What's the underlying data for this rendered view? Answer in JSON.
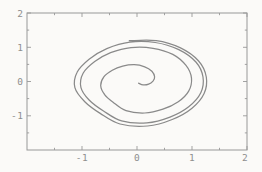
{
  "figure": {
    "background_color": "#fbfaf8",
    "frame_color": "#989898",
    "curve_color": "#8a8a8a",
    "label_color": "#8e8e8e"
  },
  "chart_data": {
    "type": "line",
    "title": "",
    "xlabel": "",
    "ylabel": "",
    "xlim": [
      -2,
      2
    ],
    "ylim": [
      -2,
      2
    ],
    "grid": false,
    "legend_position": "none",
    "framed": true,
    "x_ticks": {
      "major": [
        {
          "value": -1,
          "label": "-1"
        },
        {
          "value": 0,
          "label": "0"
        },
        {
          "value": 1,
          "label": "1"
        },
        {
          "value": 2,
          "label": "2"
        }
      ],
      "minor": [
        -1.5,
        -0.5,
        0.5,
        1.5
      ]
    },
    "y_ticks": {
      "major": [
        {
          "value": 2,
          "label": "2"
        },
        {
          "value": 1,
          "label": "1"
        },
        {
          "value": 0,
          "label": "0"
        },
        {
          "value": -1,
          "label": "-1"
        }
      ],
      "minor": [
        -1.5,
        -0.5,
        0.5,
        1.5
      ]
    },
    "series": [
      {
        "name": "phase-trajectory",
        "description": "Trajectory spiraling outward from near the origin onto a closed limit cycle (phase-plane portrait), winding counterclockwise about 3.5 turns",
        "points": [
          [
            0.03,
            -0.05
          ],
          [
            0.11,
            -0.1
          ],
          [
            0.21,
            -0.08
          ],
          [
            0.29,
            0.01
          ],
          [
            0.32,
            0.14
          ],
          [
            0.27,
            0.3
          ],
          [
            0.14,
            0.43
          ],
          [
            -0.05,
            0.49
          ],
          [
            -0.26,
            0.45
          ],
          [
            -0.45,
            0.33
          ],
          [
            -0.6,
            0.14
          ],
          [
            -0.66,
            -0.12
          ],
          [
            -0.59,
            -0.38
          ],
          [
            -0.43,
            -0.61
          ],
          [
            -0.2,
            -0.85
          ],
          [
            0.14,
            -0.92
          ],
          [
            0.47,
            -0.81
          ],
          [
            0.75,
            -0.59
          ],
          [
            0.94,
            -0.28
          ],
          [
            0.99,
            0.1
          ],
          [
            0.89,
            0.47
          ],
          [
            0.65,
            0.79
          ],
          [
            0.29,
            0.97
          ],
          [
            -0.11,
            0.99
          ],
          [
            -0.48,
            0.84
          ],
          [
            -0.77,
            0.58
          ],
          [
            -0.98,
            0.24
          ],
          [
            -1.02,
            -0.17
          ],
          [
            -0.87,
            -0.54
          ],
          [
            -0.61,
            -0.86
          ],
          [
            -0.28,
            -1.15
          ],
          [
            0.18,
            -1.21
          ],
          [
            0.6,
            -1.04
          ],
          [
            0.94,
            -0.74
          ],
          [
            1.16,
            -0.33
          ],
          [
            1.2,
            0.13
          ],
          [
            1.07,
            0.57
          ],
          [
            0.76,
            0.93
          ],
          [
            0.33,
            1.14
          ],
          [
            -0.13,
            1.15
          ],
          [
            -0.55,
            0.96
          ],
          [
            -0.87,
            0.65
          ],
          [
            -1.09,
            0.27
          ],
          [
            -1.13,
            -0.18
          ],
          [
            -0.95,
            -0.59
          ],
          [
            -0.67,
            -0.93
          ],
          [
            -0.31,
            -1.24
          ],
          [
            0.19,
            -1.3
          ],
          [
            0.64,
            -1.11
          ],
          [
            1.0,
            -0.78
          ],
          [
            1.22,
            -0.35
          ],
          [
            1.26,
            0.13
          ],
          [
            1.12,
            0.6
          ],
          [
            0.79,
            0.98
          ],
          [
            0.35,
            1.19
          ],
          [
            -0.14,
            1.19
          ]
        ]
      }
    ]
  }
}
